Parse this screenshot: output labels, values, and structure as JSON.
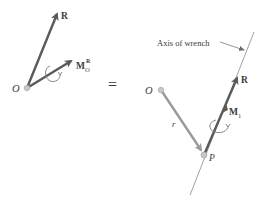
{
  "colors": {
    "vector_dark": "#5a5a5a",
    "vector_light": "#9a9a9a",
    "point_fill": "#c8c8c8",
    "axis_line": "#8a8a8a",
    "text": "#3a3a3a"
  },
  "left_system": {
    "origin_label": "O",
    "resultant_label": "R",
    "moment_label_main": "M",
    "moment_label_sub": "O",
    "moment_label_sup": "R"
  },
  "equals_sign": "=",
  "right_system": {
    "origin_label": "O",
    "point_label": "P",
    "position_vector_label": "r",
    "resultant_label": "R",
    "moment_label_main": "M",
    "moment_label_sub": "1",
    "axis_annotation": "Axis of wrench"
  }
}
